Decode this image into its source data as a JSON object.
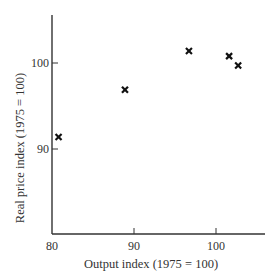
{
  "chart_data": {
    "type": "scatter",
    "title": "",
    "xlabel": "Output index (1975 = 100)",
    "ylabel": "Real price index (1975 = 100)",
    "xlim": [
      80,
      106.5
    ],
    "ylim": [
      80.2,
      105.6
    ],
    "xticks": [
      80,
      90,
      100
    ],
    "yticks": [
      90,
      100
    ],
    "xtick_labels": [
      "80",
      "90",
      "100"
    ],
    "ytick_labels": [
      "90",
      "100"
    ],
    "grid": false,
    "legend": null,
    "marker": "x",
    "series": [
      {
        "name": "observations",
        "points": [
          {
            "x": 80.8,
            "y": 91.4
          },
          {
            "x": 88.9,
            "y": 96.9
          },
          {
            "x": 96.7,
            "y": 101.4
          },
          {
            "x": 101.6,
            "y": 100.8
          },
          {
            "x": 102.7,
            "y": 99.7
          }
        ]
      }
    ]
  }
}
